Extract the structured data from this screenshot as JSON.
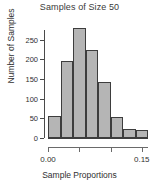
{
  "chart_data": {
    "type": "bar",
    "title": "Samples of Size 50",
    "xlabel": "Sample Proportions",
    "ylabel": "Number of Samples",
    "categories": [
      "0.00-0.02",
      "0.02-0.04",
      "0.04-0.06",
      "0.06-0.08",
      "0.08-0.10",
      "0.10-0.12",
      "0.12-0.14",
      "0.14-0.16"
    ],
    "bin_edges": [
      0.0,
      0.02,
      0.04,
      0.06,
      0.08,
      0.1,
      0.12,
      0.14,
      0.16
    ],
    "values": [
      55,
      196,
      280,
      223,
      142,
      54,
      23,
      20
    ],
    "x": [
      0.01,
      0.03,
      0.05,
      0.07,
      0.09,
      0.11,
      0.13,
      0.15
    ],
    "xlim": [
      0.0,
      0.16
    ],
    "ylim": [
      0,
      290
    ],
    "y_ticks": [
      0,
      50,
      100,
      150,
      200,
      250
    ],
    "y_tick_labels": [
      "0",
      "50",
      "100",
      "150",
      "200",
      "250"
    ],
    "x_ticks": [
      0.0,
      0.05,
      0.1,
      0.15
    ],
    "x_tick_labels": [
      "0.00",
      "",
      "",
      "0.15"
    ],
    "grid": false,
    "legend": false,
    "bar_fill_color": "#b5b5b5",
    "bar_edge_color": "#3d3d3d",
    "axis_color": "#4a4a4a",
    "text_color": "#2f2f2f",
    "background_color": "#ffffff"
  }
}
